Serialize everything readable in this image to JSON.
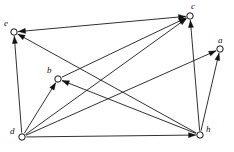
{
  "figure": {
    "type": "directed-graph",
    "width": 234,
    "height": 152,
    "background_color": "#ffffff",
    "stroke_color": "#111111",
    "node_fill_color": "#ffffff"
  },
  "nodes": [
    {
      "id": "a",
      "label": "a",
      "x": 220,
      "y": 49,
      "r": 3.2,
      "label_dx": -2,
      "label_dy": -13
    },
    {
      "id": "b",
      "label": "b",
      "x": 58,
      "y": 79,
      "r": 3.2,
      "label_dx": -11,
      "label_dy": -13
    },
    {
      "id": "c",
      "label": "c",
      "x": 190,
      "y": 16,
      "r": 3.2,
      "label_dx": 1,
      "label_dy": -14
    },
    {
      "id": "d",
      "label": "d",
      "x": 22,
      "y": 137,
      "r": 3.2,
      "label_dx": -12,
      "label_dy": -10
    },
    {
      "id": "e",
      "label": "e",
      "x": 14,
      "y": 32,
      "r": 3.2,
      "label_dx": -10,
      "label_dy": -13
    },
    {
      "id": "h",
      "label": "h",
      "x": 200,
      "y": 135,
      "r": 3.2,
      "label_dx": 6,
      "label_dy": -10
    }
  ],
  "edges": [
    {
      "from": "e",
      "to": "c",
      "bidirectional": true,
      "name": "edge-e-c"
    },
    {
      "from": "d",
      "to": "e",
      "bidirectional": false,
      "name": "edge-d-e"
    },
    {
      "from": "d",
      "to": "b",
      "bidirectional": false,
      "name": "edge-d-b"
    },
    {
      "from": "d",
      "to": "c",
      "bidirectional": false,
      "name": "edge-d-c"
    },
    {
      "from": "d",
      "to": "a",
      "bidirectional": false,
      "name": "edge-d-a"
    },
    {
      "from": "d",
      "to": "h",
      "bidirectional": false,
      "name": "edge-d-h"
    },
    {
      "from": "h",
      "to": "e",
      "bidirectional": false,
      "name": "edge-h-e"
    },
    {
      "from": "h",
      "to": "b",
      "bidirectional": false,
      "name": "edge-h-b"
    },
    {
      "from": "h",
      "to": "c",
      "bidirectional": false,
      "name": "edge-h-c"
    },
    {
      "from": "h",
      "to": "a",
      "bidirectional": false,
      "name": "edge-h-a"
    },
    {
      "from": "b",
      "to": "c",
      "bidirectional": false,
      "name": "edge-b-c"
    }
  ]
}
